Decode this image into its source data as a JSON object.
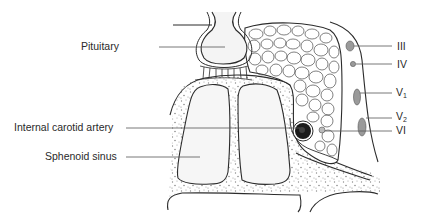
{
  "diagram": {
    "labels_left": [
      {
        "id": "pituitary",
        "text": "Pituitary"
      },
      {
        "id": "internal-carotid-artery",
        "text": "Internal carotid artery"
      },
      {
        "id": "sphenoid-sinus",
        "text": "Sphenoid sinus"
      }
    ],
    "labels_right": [
      {
        "id": "cn-iii",
        "text": "III"
      },
      {
        "id": "cn-iv",
        "text": "IV"
      },
      {
        "id": "cn-v1",
        "text": "V",
        "sub": "1"
      },
      {
        "id": "cn-v2",
        "text": "V",
        "sub": "2"
      },
      {
        "id": "cn-vi",
        "text": "VI"
      }
    ],
    "colors": {
      "outline": "#2b2b2b",
      "leader_line": "#555555",
      "nerve_fill": "#9a9a9a",
      "artery_fill": "#1a1a1a",
      "bone_stipple": "#8a8a8a",
      "sinus_fill": "#f4f4f4"
    }
  }
}
